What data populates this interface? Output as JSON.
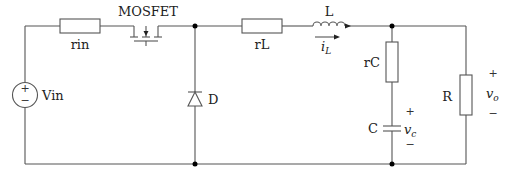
{
  "diagram": {
    "type": "circuit-schematic",
    "components": {
      "vin": {
        "label": "Vin",
        "plus": "+",
        "minus": "−"
      },
      "rin": {
        "label": "rin"
      },
      "mosfet": {
        "label": "MOSFET"
      },
      "diode": {
        "label": "D"
      },
      "rl": {
        "label": "rL"
      },
      "inductor": {
        "label": "L",
        "current": "i",
        "current_sub": "L"
      },
      "rc": {
        "label": "rC"
      },
      "capacitor": {
        "label": "C",
        "voltage": "v",
        "voltage_sub": "c",
        "plus": "+",
        "minus": "−"
      },
      "load": {
        "label": "R"
      },
      "output": {
        "voltage": "v",
        "voltage_sub": "o",
        "plus": "+",
        "minus": "−"
      }
    },
    "colors": {
      "wire": "#555555",
      "dot": "#000000",
      "text": "#222222"
    }
  }
}
